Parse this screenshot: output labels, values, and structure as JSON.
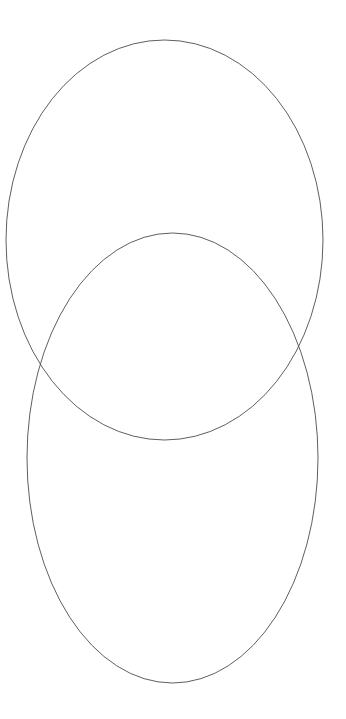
{
  "canvas": {
    "width": 346,
    "height": 719,
    "background_color": "#ffffff",
    "title": "Two Overlapping Ellipses"
  },
  "style": {
    "stroke_color": "#4d4d4d",
    "stroke_width": 0.9,
    "fill": "none"
  },
  "shapes": [
    {
      "name": "upper-ellipse",
      "label": "Upper ellipse",
      "cx": 164.5,
      "cy": 240,
      "rx": 158.5,
      "ry": 200,
      "stroke": "#4d4d4d",
      "stroke_width": 0.9,
      "fill": "none"
    },
    {
      "name": "lower-ellipse",
      "label": "Lower ellipse",
      "cx": 172.5,
      "cy": 458,
      "rx": 145.5,
      "ry": 225,
      "stroke": "#4d4d4d",
      "stroke_width": 0.9,
      "fill": "none"
    }
  ],
  "geometry": {
    "upper_ellipse_bounds": {
      "top": 40,
      "bottom": 440,
      "left": 6,
      "right": 323
    },
    "lower_ellipse_bounds": {
      "top": 233,
      "bottom": 683,
      "left": 27,
      "right": 318
    },
    "intersection_points": [
      {
        "name": "left-intersection",
        "x": 34,
        "y": 363
      },
      {
        "name": "right-intersection",
        "x": 311,
        "y": 363
      }
    ]
  },
  "chart_data": {
    "type": "diagram",
    "subtype": "venn-two-set",
    "series": [
      {
        "name": "Upper ellipse",
        "cx": 164.5,
        "cy": 240,
        "rx": 158.5,
        "ry": 200
      },
      {
        "name": "Lower ellipse",
        "cx": 172.5,
        "cy": 458,
        "rx": 145.5,
        "ry": 225
      }
    ],
    "labels": [],
    "legend": "none",
    "grid": false,
    "xlabel": "",
    "ylabel": ""
  }
}
